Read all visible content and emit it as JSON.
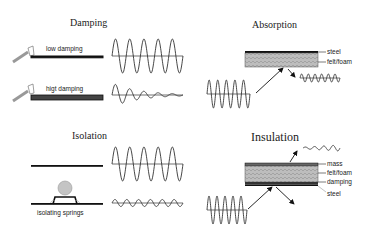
{
  "panels": {
    "damping": {
      "title": "Damping",
      "low_label": "low damping",
      "high_label": "higt damping"
    },
    "absorption": {
      "title": "Absorption",
      "layers": [
        "steel",
        "felt/foam"
      ]
    },
    "isolation": {
      "title": "Isolation",
      "springs_label": "isolating springs"
    },
    "insulation": {
      "title": "Insulation",
      "layers": [
        "mass",
        "felt/foam",
        "damping",
        "steel"
      ]
    }
  },
  "colors": {
    "line": "#111111",
    "foam": "#b8b8b8",
    "mass_ball": "#c8c8c8",
    "damping_bar": "#555555"
  }
}
